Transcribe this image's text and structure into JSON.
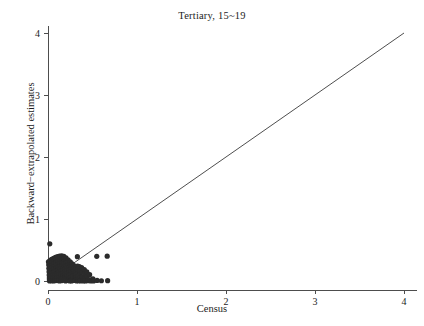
{
  "chart_data": {
    "type": "scatter",
    "title": "Tertiary, 15~19",
    "xlabel": "Census",
    "ylabel": "Backward−extrapolated estimates",
    "xlim": [
      0,
      4.15
    ],
    "ylim": [
      0,
      4.12
    ],
    "xticks": [
      0,
      1,
      2,
      3,
      4
    ],
    "xticklabels": [
      "0",
      "1",
      "2",
      "3",
      "4"
    ],
    "yticks": [
      0,
      1,
      2,
      3,
      4
    ],
    "yticklabels": [
      "0",
      "1",
      "2",
      "3",
      "4"
    ],
    "grid": false,
    "legend": null,
    "point_color": "#2b2b2b",
    "point_radius": 2.6,
    "reference_line": {
      "name": "identity-line",
      "description": "y = x diagonal reference line",
      "x": [
        0,
        4
      ],
      "y": [
        0,
        4
      ],
      "color": "#3a3a3a"
    },
    "series": [
      {
        "name": "country-observations",
        "marker": "filled-circle",
        "points": [
          [
            0.02,
            0.6
          ],
          [
            0.005,
            0.31
          ],
          [
            0.008,
            0.262
          ],
          [
            0.01,
            0.205
          ],
          [
            0.012,
            0.15
          ],
          [
            0.013,
            0.095
          ],
          [
            0.015,
            0.05
          ],
          [
            0.016,
            0.018
          ],
          [
            0.018,
            0.002
          ],
          [
            0.022,
            0.33
          ],
          [
            0.024,
            0.285
          ],
          [
            0.026,
            0.24
          ],
          [
            0.028,
            0.19
          ],
          [
            0.03,
            0.14
          ],
          [
            0.032,
            0.1
          ],
          [
            0.034,
            0.06
          ],
          [
            0.036,
            0.025
          ],
          [
            0.038,
            0.005
          ],
          [
            0.04,
            0.35
          ],
          [
            0.042,
            0.3
          ],
          [
            0.044,
            0.255
          ],
          [
            0.046,
            0.215
          ],
          [
            0.048,
            0.172
          ],
          [
            0.05,
            0.128
          ],
          [
            0.052,
            0.088
          ],
          [
            0.054,
            0.048
          ],
          [
            0.056,
            0.012
          ],
          [
            0.058,
            0.0
          ],
          [
            0.062,
            0.365
          ],
          [
            0.064,
            0.32
          ],
          [
            0.066,
            0.275
          ],
          [
            0.068,
            0.232
          ],
          [
            0.07,
            0.19
          ],
          [
            0.072,
            0.148
          ],
          [
            0.074,
            0.105
          ],
          [
            0.076,
            0.062
          ],
          [
            0.078,
            0.028
          ],
          [
            0.08,
            0.004
          ],
          [
            0.084,
            0.38
          ],
          [
            0.086,
            0.34
          ],
          [
            0.088,
            0.296
          ],
          [
            0.09,
            0.252
          ],
          [
            0.092,
            0.21
          ],
          [
            0.094,
            0.168
          ],
          [
            0.096,
            0.124
          ],
          [
            0.098,
            0.082
          ],
          [
            0.1,
            0.042
          ],
          [
            0.102,
            0.01
          ],
          [
            0.106,
            0.392
          ],
          [
            0.108,
            0.352
          ],
          [
            0.11,
            0.31
          ],
          [
            0.112,
            0.268
          ],
          [
            0.114,
            0.225
          ],
          [
            0.116,
            0.182
          ],
          [
            0.118,
            0.14
          ],
          [
            0.12,
            0.098
          ],
          [
            0.122,
            0.056
          ],
          [
            0.124,
            0.02
          ],
          [
            0.126,
            0.0
          ],
          [
            0.13,
            0.4
          ],
          [
            0.132,
            0.362
          ],
          [
            0.134,
            0.322
          ],
          [
            0.136,
            0.28
          ],
          [
            0.138,
            0.238
          ],
          [
            0.14,
            0.196
          ],
          [
            0.142,
            0.154
          ],
          [
            0.144,
            0.112
          ],
          [
            0.146,
            0.072
          ],
          [
            0.148,
            0.034
          ],
          [
            0.15,
            0.006
          ],
          [
            0.154,
            0.405
          ],
          [
            0.156,
            0.368
          ],
          [
            0.158,
            0.33
          ],
          [
            0.16,
            0.29
          ],
          [
            0.162,
            0.248
          ],
          [
            0.164,
            0.206
          ],
          [
            0.166,
            0.164
          ],
          [
            0.168,
            0.122
          ],
          [
            0.17,
            0.082
          ],
          [
            0.172,
            0.044
          ],
          [
            0.174,
            0.012
          ],
          [
            0.178,
            0.398
          ],
          [
            0.18,
            0.358
          ],
          [
            0.182,
            0.318
          ],
          [
            0.184,
            0.276
          ],
          [
            0.186,
            0.234
          ],
          [
            0.188,
            0.192
          ],
          [
            0.19,
            0.15
          ],
          [
            0.192,
            0.11
          ],
          [
            0.194,
            0.07
          ],
          [
            0.196,
            0.032
          ],
          [
            0.198,
            0.002
          ],
          [
            0.202,
            0.372
          ],
          [
            0.204,
            0.33
          ],
          [
            0.206,
            0.288
          ],
          [
            0.208,
            0.246
          ],
          [
            0.21,
            0.204
          ],
          [
            0.212,
            0.162
          ],
          [
            0.214,
            0.12
          ],
          [
            0.216,
            0.08
          ],
          [
            0.218,
            0.042
          ],
          [
            0.22,
            0.01
          ],
          [
            0.226,
            0.34
          ],
          [
            0.228,
            0.3
          ],
          [
            0.23,
            0.258
          ],
          [
            0.232,
            0.216
          ],
          [
            0.234,
            0.176
          ],
          [
            0.236,
            0.134
          ],
          [
            0.238,
            0.094
          ],
          [
            0.24,
            0.054
          ],
          [
            0.242,
            0.018
          ],
          [
            0.244,
            0.0
          ],
          [
            0.25,
            0.31
          ],
          [
            0.252,
            0.27
          ],
          [
            0.254,
            0.23
          ],
          [
            0.256,
            0.188
          ],
          [
            0.258,
            0.148
          ],
          [
            0.26,
            0.108
          ],
          [
            0.262,
            0.068
          ],
          [
            0.264,
            0.03
          ],
          [
            0.266,
            0.002
          ],
          [
            0.272,
            0.275
          ],
          [
            0.274,
            0.236
          ],
          [
            0.276,
            0.196
          ],
          [
            0.278,
            0.156
          ],
          [
            0.28,
            0.116
          ],
          [
            0.282,
            0.078
          ],
          [
            0.284,
            0.04
          ],
          [
            0.286,
            0.008
          ],
          [
            0.292,
            0.25
          ],
          [
            0.294,
            0.208
          ],
          [
            0.296,
            0.168
          ],
          [
            0.298,
            0.128
          ],
          [
            0.3,
            0.088
          ],
          [
            0.302,
            0.05
          ],
          [
            0.304,
            0.014
          ],
          [
            0.31,
            0.225
          ],
          [
            0.312,
            0.185
          ],
          [
            0.314,
            0.145
          ],
          [
            0.316,
            0.105
          ],
          [
            0.318,
            0.066
          ],
          [
            0.32,
            0.028
          ],
          [
            0.322,
            0.0
          ],
          [
            0.33,
            0.392
          ],
          [
            0.332,
            0.24
          ],
          [
            0.334,
            0.17
          ],
          [
            0.336,
            0.12
          ],
          [
            0.338,
            0.075
          ],
          [
            0.34,
            0.034
          ],
          [
            0.342,
            0.004
          ],
          [
            0.352,
            0.232
          ],
          [
            0.356,
            0.16
          ],
          [
            0.358,
            0.1
          ],
          [
            0.36,
            0.05
          ],
          [
            0.362,
            0.01
          ],
          [
            0.364,
            0.0
          ],
          [
            0.378,
            0.215
          ],
          [
            0.382,
            0.142
          ],
          [
            0.386,
            0.062
          ],
          [
            0.39,
            0.012
          ],
          [
            0.396,
            0.0
          ],
          [
            0.408,
            0.185
          ],
          [
            0.412,
            0.118
          ],
          [
            0.416,
            0.04
          ],
          [
            0.42,
            0.002
          ],
          [
            0.436,
            0.148
          ],
          [
            0.44,
            0.07
          ],
          [
            0.446,
            0.006
          ],
          [
            0.468,
            0.102
          ],
          [
            0.474,
            0.018
          ],
          [
            0.48,
            0.0
          ],
          [
            0.505,
            0.035
          ],
          [
            0.512,
            0.002
          ],
          [
            0.548,
            0.398
          ],
          [
            0.552,
            0.01
          ],
          [
            0.6,
            0.004
          ],
          [
            0.665,
            0.4
          ],
          [
            0.67,
            0.006
          ]
        ]
      }
    ]
  }
}
